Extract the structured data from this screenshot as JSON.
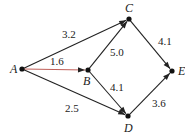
{
  "graph": {
    "type": "directed-weighted-graph",
    "nodes": [
      {
        "id": "A",
        "label": "A"
      },
      {
        "id": "B",
        "label": "B"
      },
      {
        "id": "C",
        "label": "C"
      },
      {
        "id": "D",
        "label": "D"
      },
      {
        "id": "E",
        "label": "E"
      }
    ],
    "edges": [
      {
        "from": "A",
        "to": "C",
        "weight": "3.2",
        "color": "#222222"
      },
      {
        "from": "A",
        "to": "B",
        "weight": "1.6",
        "color": "#c0605a"
      },
      {
        "from": "A",
        "to": "D",
        "weight": "2.5",
        "color": "#222222"
      },
      {
        "from": "B",
        "to": "C",
        "weight": "5.0",
        "color": "#222222"
      },
      {
        "from": "B",
        "to": "D",
        "weight": "4.1",
        "color": "#222222"
      },
      {
        "from": "C",
        "to": "E",
        "weight": "4.1",
        "color": "#222222"
      },
      {
        "from": "D",
        "to": "E",
        "weight": "3.6",
        "color": "#222222"
      }
    ]
  }
}
